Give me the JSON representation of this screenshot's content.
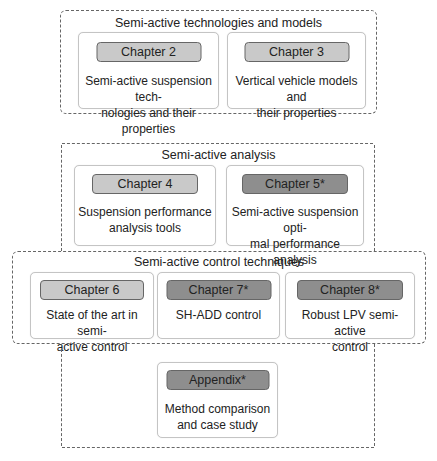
{
  "colors": {
    "light_chip": "#c9c9c9",
    "dark_chip": "#8e8e8e",
    "border": "#666666"
  },
  "groups": {
    "technologies": {
      "title": "Semi-active technologies and models",
      "cards": [
        {
          "chip": "Chapter 2",
          "style": "light",
          "desc": "Semi-active suspension tech-\nnologies and their properties"
        },
        {
          "chip": "Chapter 3",
          "style": "light",
          "desc": "Vertical vehicle models and\ntheir properties"
        }
      ]
    },
    "analysis": {
      "title": "Semi-active analysis",
      "cards": [
        {
          "chip": "Chapter 4",
          "style": "light",
          "desc": "Suspension performance\nanalysis tools"
        },
        {
          "chip": "Chapter 5*",
          "style": "dark",
          "desc": "Semi-active suspension opti-\nmal performance analysis"
        }
      ]
    },
    "control": {
      "title": "Semi-active control techniques",
      "cards": [
        {
          "chip": "Chapter 6",
          "style": "light",
          "desc": "State of the art in semi-\nactive control"
        },
        {
          "chip": "Chapter 7*",
          "style": "dark",
          "desc": "SH-ADD control"
        },
        {
          "chip": "Chapter 8*",
          "style": "dark",
          "desc": "Robust LPV semi-active\ncontrol"
        }
      ]
    },
    "appendix": {
      "cards": [
        {
          "chip": "Appendix*",
          "style": "dark",
          "desc": "Method comparison\nand case study"
        }
      ]
    }
  }
}
